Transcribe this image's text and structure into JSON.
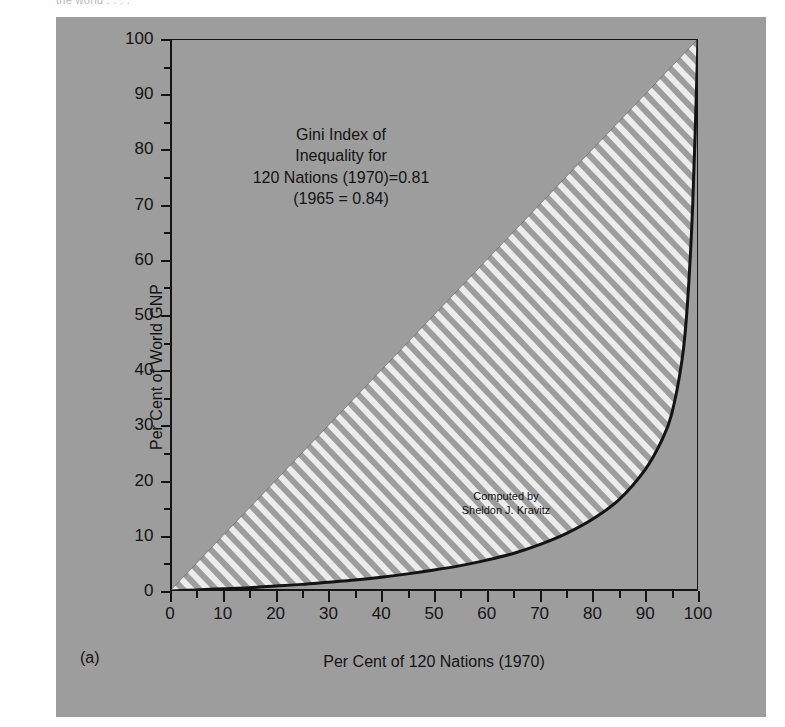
{
  "top_cropped_caption": "the world  .  . . .",
  "figure": {
    "panel_label": "(a)",
    "x_axis_title": "Per Cent of 120 Nations (1970)",
    "y_axis_title": "Per Cent of World GNP",
    "annotation": {
      "line1": "Gini Index of",
      "line2": "Inequality for",
      "line3": "120 Nations (1970)=0.81",
      "line4": "(1965 = 0.84)"
    },
    "credit": {
      "line1": "Computed by",
      "line2": "Sheldon J. Kravitz"
    },
    "colors": {
      "panel_background": "#9d9d9d",
      "ink": "#141414",
      "hatch_fill": "#e8e8e8",
      "page_background": "#ffffff"
    }
  },
  "chart_data": {
    "type": "line",
    "title": "",
    "subtitle": "",
    "xlabel": "Per Cent of 120 Nations (1970)",
    "ylabel": "Per Cent of World GNP",
    "xlim": [
      0,
      100
    ],
    "ylim": [
      0,
      100
    ],
    "xticks": [
      0,
      10,
      20,
      30,
      40,
      50,
      60,
      70,
      80,
      90,
      100
    ],
    "xtick_labels": [
      "0",
      "10",
      "20",
      "30",
      "40",
      "50",
      "60",
      "70",
      "80",
      "90",
      "100"
    ],
    "yticks": [
      0,
      10,
      20,
      30,
      40,
      50,
      60,
      70,
      80,
      90,
      100
    ],
    "ytick_labels": [
      "0",
      "10",
      "20",
      "30",
      "40",
      "50",
      "60",
      "70",
      "80",
      "90",
      "100"
    ],
    "minor_tick_interval": 5,
    "grid": false,
    "legend": null,
    "gini_index_1970": 0.81,
    "gini_index_1965": 0.84,
    "shaded_region": "area between line of equality and Lorenz curve, white diagonal hatching",
    "series": [
      {
        "name": "Line of Equality",
        "style": "thin solid",
        "x": [
          0,
          100
        ],
        "values": [
          0,
          100
        ]
      },
      {
        "name": "Lorenz Curve (120 Nations, 1970)",
        "style": "thick solid",
        "x": [
          0,
          5,
          10,
          15,
          20,
          25,
          30,
          35,
          40,
          45,
          50,
          55,
          60,
          65,
          70,
          75,
          80,
          85,
          90,
          93,
          95,
          97,
          98,
          99,
          100
        ],
        "values": [
          0,
          0.2,
          0.4,
          0.6,
          0.9,
          1.2,
          1.6,
          2.0,
          2.5,
          3.1,
          3.8,
          4.6,
          5.6,
          6.8,
          8.4,
          10.4,
          13.0,
          16.5,
          22.0,
          27.0,
          32.0,
          42.0,
          52.0,
          70.0,
          100.0
        ]
      }
    ]
  }
}
